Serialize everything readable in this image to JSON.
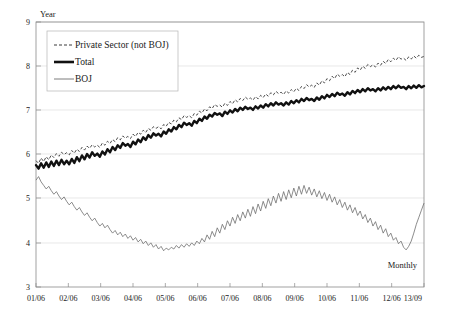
{
  "chart_data": {
    "type": "line",
    "title": "",
    "xlabel": "",
    "ylabel": "Year",
    "frequency_note": "Monthly",
    "ylim": [
      3,
      9
    ],
    "yticks": [
      3,
      4,
      5,
      6,
      7,
      8,
      9
    ],
    "grid": true,
    "legend_position": "upper-left",
    "xtick_labels": [
      "01/06",
      "02/06",
      "03/06",
      "04/06",
      "05/06",
      "06/06",
      "07/06",
      "08/06",
      "09/06",
      "10/06",
      "11/06",
      "12/06",
      "13/09"
    ],
    "x_start": "01/06",
    "x_end": "13/09",
    "series": [
      {
        "name": "Private Sector (not BOJ)",
        "style": "dashed",
        "color": "#3a3a3a",
        "values": [
          5.86,
          5.8,
          5.92,
          5.84,
          5.95,
          5.88,
          5.99,
          5.93,
          6.02,
          5.96,
          6.05,
          6.0,
          6.04,
          5.99,
          6.09,
          6.03,
          6.12,
          6.07,
          6.16,
          6.1,
          6.19,
          6.14,
          6.22,
          6.17,
          6.21,
          6.16,
          6.26,
          6.21,
          6.3,
          6.25,
          6.34,
          6.29,
          6.38,
          6.33,
          6.42,
          6.37,
          6.41,
          6.36,
          6.46,
          6.41,
          6.5,
          6.46,
          6.55,
          6.5,
          6.59,
          6.55,
          6.63,
          6.59,
          6.63,
          6.58,
          6.68,
          6.64,
          6.73,
          6.69,
          6.78,
          6.74,
          6.83,
          6.79,
          6.88,
          6.84,
          6.88,
          6.83,
          6.93,
          6.89,
          6.98,
          6.94,
          7.03,
          6.99,
          7.08,
          7.04,
          7.13,
          7.09,
          7.12,
          7.07,
          7.16,
          7.11,
          7.2,
          7.15,
          7.24,
          7.19,
          7.27,
          7.22,
          7.3,
          7.25,
          7.28,
          7.23,
          7.31,
          7.26,
          7.34,
          7.29,
          7.37,
          7.32,
          7.4,
          7.35,
          7.43,
          7.38,
          7.41,
          7.36,
          7.44,
          7.39,
          7.47,
          7.42,
          7.5,
          7.45,
          7.54,
          7.49,
          7.58,
          7.53,
          7.57,
          7.52,
          7.62,
          7.57,
          7.67,
          7.62,
          7.72,
          7.67,
          7.77,
          7.72,
          7.82,
          7.77,
          7.81,
          7.76,
          7.86,
          7.81,
          7.91,
          7.86,
          7.96,
          7.91,
          8.0,
          7.95,
          8.04,
          7.99,
          8.03,
          7.98,
          8.07,
          8.02,
          8.11,
          8.06,
          8.15,
          8.1,
          8.18,
          8.13,
          8.21,
          8.16,
          8.18,
          8.13,
          8.21,
          8.16,
          8.23,
          8.18,
          8.25,
          8.2,
          8.22
        ]
      },
      {
        "name": "Total",
        "style": "solid-thick",
        "color": "#111111",
        "values": [
          5.76,
          5.68,
          5.8,
          5.7,
          5.82,
          5.72,
          5.84,
          5.74,
          5.86,
          5.76,
          5.88,
          5.78,
          5.86,
          5.78,
          5.9,
          5.81,
          5.94,
          5.85,
          5.98,
          5.89,
          6.01,
          5.93,
          6.05,
          5.97,
          6.02,
          5.95,
          6.07,
          6.0,
          6.12,
          6.05,
          6.17,
          6.1,
          6.21,
          6.15,
          6.26,
          6.2,
          6.24,
          6.17,
          6.29,
          6.23,
          6.34,
          6.28,
          6.39,
          6.33,
          6.44,
          6.38,
          6.48,
          6.43,
          6.47,
          6.41,
          6.52,
          6.47,
          6.57,
          6.52,
          6.62,
          6.57,
          6.67,
          6.62,
          6.72,
          6.67,
          6.71,
          6.65,
          6.76,
          6.71,
          6.81,
          6.76,
          6.86,
          6.81,
          6.9,
          6.86,
          6.94,
          6.9,
          6.93,
          6.87,
          6.97,
          6.92,
          7.0,
          6.95,
          7.03,
          6.98,
          7.06,
          7.01,
          7.08,
          7.03,
          7.06,
          7.01,
          7.09,
          7.04,
          7.11,
          7.06,
          7.14,
          7.09,
          7.16,
          7.11,
          7.18,
          7.13,
          7.16,
          7.11,
          7.18,
          7.13,
          7.21,
          7.16,
          7.23,
          7.18,
          7.26,
          7.21,
          7.28,
          7.23,
          7.26,
          7.21,
          7.29,
          7.24,
          7.32,
          7.27,
          7.35,
          7.3,
          7.37,
          7.32,
          7.4,
          7.35,
          7.38,
          7.33,
          7.41,
          7.36,
          7.44,
          7.39,
          7.46,
          7.41,
          7.48,
          7.43,
          7.5,
          7.45,
          7.48,
          7.43,
          7.5,
          7.45,
          7.52,
          7.47,
          7.53,
          7.48,
          7.55,
          7.5,
          7.56,
          7.51,
          7.53,
          7.48,
          7.55,
          7.5,
          7.56,
          7.51,
          7.57,
          7.52,
          7.55
        ]
      },
      {
        "name": "BOJ",
        "style": "solid-thin",
        "color": "#6e6e6e",
        "values": [
          5.42,
          5.5,
          5.38,
          5.3,
          5.22,
          5.28,
          5.18,
          5.1,
          5.16,
          5.06,
          4.98,
          5.04,
          4.94,
          4.86,
          4.92,
          4.82,
          4.74,
          4.8,
          4.7,
          4.62,
          4.68,
          4.58,
          4.5,
          4.56,
          4.46,
          4.38,
          4.44,
          4.34,
          4.4,
          4.3,
          4.22,
          4.28,
          4.18,
          4.24,
          4.14,
          4.2,
          4.1,
          4.16,
          4.06,
          4.12,
          4.02,
          4.08,
          3.98,
          4.04,
          3.94,
          4.0,
          3.9,
          3.96,
          3.86,
          3.92,
          3.82,
          3.88,
          3.84,
          3.9,
          3.86,
          3.94,
          3.88,
          3.96,
          3.9,
          3.98,
          3.92,
          4.0,
          3.94,
          4.04,
          3.98,
          4.1,
          4.02,
          4.18,
          4.08,
          4.26,
          4.14,
          4.34,
          4.22,
          4.42,
          4.3,
          4.5,
          4.38,
          4.58,
          4.44,
          4.64,
          4.5,
          4.7,
          4.56,
          4.76,
          4.6,
          4.82,
          4.66,
          4.88,
          4.72,
          4.94,
          4.78,
          5.0,
          4.84,
          5.06,
          4.9,
          5.12,
          4.94,
          5.16,
          4.98,
          5.2,
          5.02,
          5.24,
          5.06,
          5.28,
          5.1,
          5.3,
          5.12,
          5.26,
          5.08,
          5.22,
          5.04,
          5.18,
          5.0,
          5.14,
          4.96,
          5.1,
          4.92,
          5.04,
          4.86,
          4.98,
          4.8,
          4.92,
          4.74,
          4.86,
          4.68,
          4.8,
          4.62,
          4.72,
          4.54,
          4.64,
          4.46,
          4.56,
          4.38,
          4.48,
          4.3,
          4.4,
          4.22,
          4.32,
          4.14,
          4.22,
          4.06,
          4.12,
          3.98,
          4.04,
          3.9,
          3.84,
          3.92,
          4.04,
          4.22,
          4.42,
          4.58,
          4.74,
          4.9
        ]
      }
    ]
  },
  "legend": {
    "items": [
      {
        "label": "Private Sector (not BOJ)"
      },
      {
        "label": "Total"
      },
      {
        "label": "BOJ"
      }
    ]
  }
}
